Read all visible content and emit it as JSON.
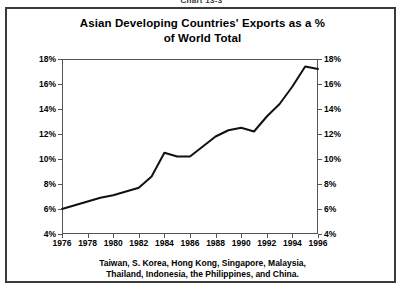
{
  "caption": "Chart 13-3",
  "title": {
    "line1": "Asian Developing Countries' Exports as a %",
    "line2": "of World Total"
  },
  "footnote": {
    "line1": "Taiwan, S. Korea, Hong Kong, Singapore, Malaysia,",
    "line2": "Thailand, Indonesia, the Philippines, and China."
  },
  "chart_data": {
    "type": "line",
    "title": "Asian Developing Countries' Exports as a % of World Total",
    "subtitle": "",
    "xlabel": "",
    "ylabel": "",
    "xlim": [
      1976,
      1996
    ],
    "ylim": [
      4,
      18
    ],
    "ytick_labels": [
      "18%",
      "16%",
      "14%",
      "12%",
      "10%",
      "8%",
      "6%",
      "4%"
    ],
    "ytick_values": [
      18,
      16,
      14,
      12,
      10,
      8,
      6,
      4
    ],
    "xtick_labels": [
      "1976",
      "1978",
      "1980",
      "1982",
      "1984",
      "1986",
      "1988",
      "1990",
      "1992",
      "1994",
      "1996"
    ],
    "xtick_values": [
      1976,
      1978,
      1980,
      1982,
      1984,
      1986,
      1988,
      1990,
      1992,
      1994,
      1996
    ],
    "grid": false,
    "legend": "none",
    "dual_y_axis": true,
    "line_color": "#111111",
    "x": [
      1976,
      1977,
      1978,
      1979,
      1980,
      1981,
      1982,
      1983,
      1984,
      1985,
      1986,
      1987,
      1988,
      1989,
      1990,
      1991,
      1992,
      1993,
      1994,
      1995,
      1996
    ],
    "values": [
      6.0,
      6.3,
      6.6,
      6.9,
      7.1,
      7.4,
      7.7,
      8.6,
      10.5,
      10.2,
      10.2,
      11.0,
      11.8,
      12.3,
      12.5,
      12.2,
      13.4,
      14.4,
      15.8,
      17.4,
      17.2
    ],
    "series": [
      {
        "name": "Asian developing countries' share of world exports",
        "values": [
          6.0,
          6.3,
          6.6,
          6.9,
          7.1,
          7.4,
          7.7,
          8.6,
          10.5,
          10.2,
          10.2,
          11.0,
          11.8,
          12.3,
          12.5,
          12.2,
          13.4,
          14.4,
          15.8,
          17.4,
          17.2
        ]
      }
    ],
    "note": "Taiwan, S. Korea, Hong Kong, Singapore, Malaysia, Thailand, Indonesia, the Philippines, and China."
  }
}
